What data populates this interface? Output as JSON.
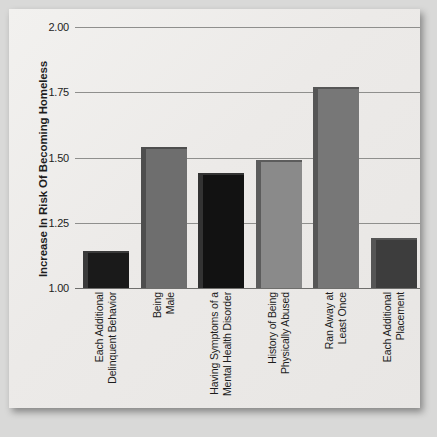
{
  "chart_data": {
    "type": "bar",
    "title": "",
    "subtitle": "",
    "xlabel": "",
    "ylabel": "Increase In Risk Of Becoming Homeless",
    "ylim": [
      1.0,
      2.0
    ],
    "yticks": [
      "1.00",
      "1.25",
      "1.50",
      "1.75",
      "2.00"
    ],
    "ytick_values": [
      1.0,
      1.25,
      1.5,
      1.75,
      2.0
    ],
    "grid": true,
    "legend": "none",
    "categories": [
      "Each Additional Delinquent Behavior",
      "Being Male",
      "Having Symptoms of a Mental Health Disorder",
      "History of Being Physically Abused",
      "Ran Away at Least Once",
      "Each Additional Placement"
    ],
    "category_lines": [
      [
        "Each Additional",
        "Delinquent Behavior"
      ],
      [
        "Being",
        "Male"
      ],
      [
        "Having Symptoms of a",
        "Mental Health Disorder"
      ],
      [
        "History of Being",
        "Physically Abused"
      ],
      [
        "Ran Away at",
        "Least Once"
      ],
      [
        "Each Additional",
        "Placement"
      ]
    ],
    "values": [
      1.14,
      1.54,
      1.44,
      1.49,
      1.77,
      1.19
    ],
    "bar_colors": [
      "#1a1a1a",
      "#6e6e6e",
      "#121212",
      "#8a8a8a",
      "#777777",
      "#3d3d3d"
    ],
    "bar_edge_colors": [
      "#3a3a3a",
      "#4e4e4e",
      "#333333",
      "#5c5c5c",
      "#565656",
      "#555555"
    ]
  },
  "colors": {
    "page_background": "#d9d9d8",
    "panel_background": "#eeedeb",
    "gridline": "#8f8f8d",
    "axis": "#6e6e6c",
    "text": "#1d1d1d"
  }
}
